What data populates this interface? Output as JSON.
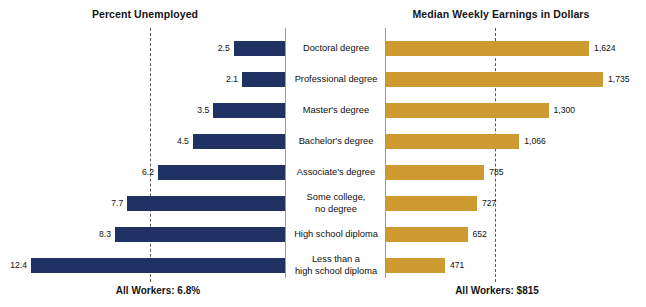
{
  "titles": {
    "left": "Percent Unemployed",
    "right": "Median Weekly Earnings in Dollars"
  },
  "footers": {
    "left": "All Workers: 6.8%",
    "right": "All Workers: $815"
  },
  "chart_data": {
    "type": "bar",
    "orientation": "horizontal",
    "layout": "butterfly",
    "grid": false,
    "legend": "none",
    "categories": [
      "Doctoral degree",
      "Professional degree",
      "Master's degree",
      "Bachelor's degree",
      "Associate's degree",
      "Some college,\nno degree",
      "High school diploma",
      "Less than a\nhigh school diploma"
    ],
    "series": [
      {
        "name": "Percent Unemployed",
        "side": "left",
        "color": "#1f3263",
        "unit": "percent",
        "xlabel": "Percent Unemployed",
        "values": [
          2.5,
          2.1,
          3.5,
          4.5,
          6.2,
          7.7,
          8.3,
          12.4
        ],
        "labels": [
          "2.5",
          "2.1",
          "3.5",
          "4.5",
          "6.2",
          "7.7",
          "8.3",
          "12.4"
        ],
        "xlim": [
          0,
          12.4
        ],
        "reference_line": {
          "label": "All Workers: 6.8%",
          "value": 6.8
        }
      },
      {
        "name": "Median Weekly Earnings in Dollars",
        "side": "right",
        "color": "#d09a33",
        "unit": "dollars",
        "xlabel": "Median Weekly Earnings in Dollars",
        "values": [
          1624,
          1735,
          1300,
          1066,
          785,
          727,
          652,
          471
        ],
        "labels": [
          "1,624",
          "1,735",
          "1,300",
          "1,066",
          "785",
          "727",
          "652",
          "471"
        ],
        "xlim": [
          0,
          1735
        ],
        "reference_line": {
          "label": "All Workers: $815",
          "value": 815
        }
      }
    ]
  }
}
